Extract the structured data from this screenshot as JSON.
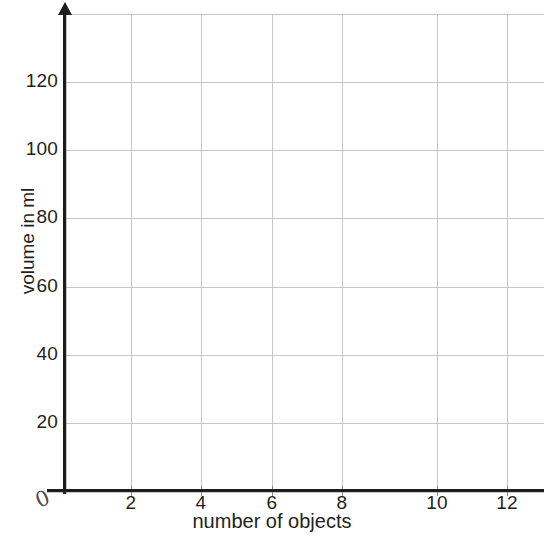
{
  "chart_data": {
    "type": "line",
    "title": "",
    "subtitle": "",
    "xlabel": "number of objects",
    "ylabel": "volume in ml",
    "xlim": [
      0,
      14
    ],
    "ylim": [
      0,
      140
    ],
    "grid": true,
    "legend": null,
    "series": [],
    "x": [],
    "values": [],
    "annotations": [],
    "origin_label": "0",
    "x_ticks": [
      {
        "value": 2,
        "label": "2",
        "px": 131
      },
      {
        "value": 4,
        "label": "4",
        "px": 201
      },
      {
        "value": 6,
        "label": "6",
        "px": 272
      },
      {
        "value": 8,
        "label": "8",
        "px": 342
      },
      {
        "value": 10,
        "label": "10",
        "px": 437
      },
      {
        "value": 12,
        "label": "12",
        "px": 507
      }
    ],
    "x_gridlines": [
      131,
      201,
      272,
      342,
      437,
      507
    ],
    "y_ticks": [
      {
        "value": 20,
        "label": "20",
        "px": 423
      },
      {
        "value": 40,
        "label": "40",
        "px": 355
      },
      {
        "value": 60,
        "label": "60",
        "px": 287
      },
      {
        "value": 80,
        "label": "80",
        "px": 218
      },
      {
        "value": 100,
        "label": "100",
        "px": 150
      },
      {
        "value": 120,
        "label": "120",
        "px": 82
      }
    ],
    "y_gridlines": [
      14,
      82,
      150,
      218,
      287,
      355,
      423
    ],
    "colors": {
      "background": "#ffffff",
      "axis": "#1c1c1c",
      "gridline": "#c6c6c6",
      "text": "#231f20",
      "tick_mark": "#8a8a8a"
    }
  }
}
